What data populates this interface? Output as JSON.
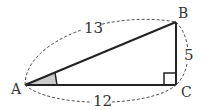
{
  "diagram": {
    "type": "right-triangle",
    "vertices": {
      "A": {
        "label": "A"
      },
      "B": {
        "label": "B"
      },
      "C": {
        "label": "C"
      }
    },
    "sides": {
      "AB": {
        "label": "13"
      },
      "BC": {
        "label": "5"
      },
      "AC": {
        "label": "12"
      }
    },
    "right_angle_at": "C",
    "marked_angle_at": "A",
    "colors": {
      "line": "#222222",
      "dashed": "#555555",
      "angle_fill": "#cccccc"
    }
  }
}
